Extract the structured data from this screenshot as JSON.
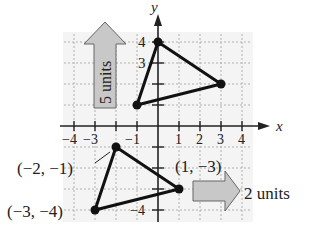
{
  "figure": {
    "axis": {
      "x_label": "x",
      "y_label": "y",
      "x_ticks": [
        "−4",
        "−3",
        "−1",
        "1",
        "2",
        "3",
        "4"
      ],
      "x_tick_values": [
        -4,
        -3,
        -1,
        1,
        2,
        3,
        4
      ],
      "y_ticks_shown": [
        "4",
        "3",
        "−4"
      ],
      "grid_range": {
        "x": [
          -4,
          4
        ],
        "y": [
          -4,
          4
        ]
      }
    },
    "original_triangle": {
      "vertices": [
        {
          "label": "(−2, −1)",
          "x": -2,
          "y": -1
        },
        {
          "label": "(1, −3)",
          "x": 1,
          "y": -3
        },
        {
          "label": "(−3, −4)",
          "x": -3,
          "y": -4
        }
      ]
    },
    "translated_triangle": {
      "vertices": [
        {
          "x": 0,
          "y": 4
        },
        {
          "x": 3,
          "y": 2
        },
        {
          "x": -1,
          "y": 1
        }
      ]
    },
    "arrows": {
      "up": {
        "label": "5 units",
        "direction": "up"
      },
      "right": {
        "label": "2 units",
        "direction": "right"
      }
    },
    "colors": {
      "grid": "#b0b0b0",
      "grid_bg": "#f2f2f2",
      "axis": "#222222",
      "triangle": "#111111",
      "arrow_fill": "#c8c8c8",
      "arrow_stroke": "#666666"
    }
  }
}
